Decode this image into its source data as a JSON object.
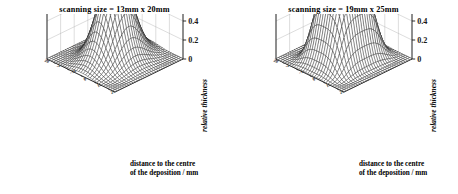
{
  "figure": {
    "background_color": "#ffffff",
    "ink_color": "#1a1a1a",
    "grid_color": "#b4b4b4"
  },
  "panels": [
    {
      "id": "left",
      "title": "scanning size =  13mm x 20mm",
      "scanning_size": "13mm x 20mm",
      "xlabel_line1": "distance to the centre",
      "xlabel_line2": "of the deposition / mm",
      "zlabel": "relative thickness",
      "z_ticks": [
        "1",
        "0.8",
        "0.6",
        "0.4",
        "0.2",
        "0"
      ],
      "x_ticks": [
        "-20",
        "-10",
        "0",
        "10",
        "20"
      ],
      "y_ticks": [
        "-20",
        "-10",
        "0",
        "10",
        "20"
      ]
    },
    {
      "id": "right",
      "title": "scanning size =  19mm x 25mm",
      "scanning_size": "19mm x 25mm",
      "xlabel_line1": "distance to the centre",
      "xlabel_line2": "of the deposition / mm",
      "zlabel": "relative thickness",
      "z_ticks": [
        "1",
        "0.8",
        "0.6",
        "0.4",
        "0.2",
        "0"
      ],
      "x_ticks": [
        "-20",
        "-10",
        "0",
        "10",
        "20"
      ],
      "y_ticks": [
        "-20",
        "-10",
        "0",
        "10",
        "20"
      ]
    }
  ],
  "chart_data": [
    {
      "type": "surface",
      "panel": "left",
      "title": "scanning size =  13mm x 20mm",
      "xlabel": "distance to the centre of the deposition / mm",
      "ylabel": "distance to the centre of the deposition / mm",
      "zlabel": "relative thickness",
      "zlim": [
        0,
        1
      ],
      "z_ticks": [
        0,
        0.2,
        0.4,
        0.6,
        0.8,
        1
      ],
      "xlim": [
        -25,
        25
      ],
      "ylim": [
        -25,
        25
      ],
      "x_ticks": [
        -20,
        -10,
        0,
        10,
        20
      ],
      "y_ticks": [
        -20,
        -10,
        0,
        10,
        20
      ],
      "grid": true,
      "legend": "none",
      "mesh_n": 30,
      "surface_model": {
        "form": "gaussian_peak",
        "peak_value": 1.0,
        "centre_x": 0,
        "centre_y": 0,
        "sigma_x": 7.5,
        "sigma_y": 9.5,
        "flatness_exponent": 2.0,
        "note": "sharp single peak, narrow scan area 13mm x 20mm"
      },
      "z_profile_along_x_at_y0": [
        0.01,
        0.02,
        0.04,
        0.08,
        0.16,
        0.3,
        0.5,
        0.72,
        0.9,
        1.0,
        0.9,
        0.72,
        0.5,
        0.3,
        0.16,
        0.08,
        0.04,
        0.02,
        0.01
      ]
    },
    {
      "type": "surface",
      "panel": "right",
      "title": "scanning size =  19mm x 25mm",
      "xlabel": "distance to the centre of the deposition / mm",
      "ylabel": "distance to the centre of the deposition / mm",
      "zlabel": "relative thickness",
      "zlim": [
        0,
        1
      ],
      "z_ticks": [
        0,
        0.2,
        0.4,
        0.6,
        0.8,
        1
      ],
      "xlim": [
        -25,
        25
      ],
      "ylim": [
        -25,
        25
      ],
      "x_ticks": [
        -20,
        -10,
        0,
        10,
        20
      ],
      "y_ticks": [
        -20,
        -10,
        0,
        10,
        20
      ],
      "grid": true,
      "legend": "none",
      "mesh_n": 30,
      "surface_model": {
        "form": "super_gaussian_plateau",
        "peak_value": 1.0,
        "centre_x": 0,
        "centre_y": 0,
        "sigma_x": 11.0,
        "sigma_y": 13.0,
        "flatness_exponent": 3.4,
        "note": "broader, flat-topped plateau, wider scan area 19mm x 25mm"
      },
      "z_profile_along_x_at_y0": [
        0.02,
        0.05,
        0.12,
        0.28,
        0.52,
        0.76,
        0.92,
        0.98,
        1.0,
        1.0,
        1.0,
        0.98,
        0.92,
        0.76,
        0.52,
        0.28,
        0.12,
        0.05,
        0.02
      ]
    }
  ]
}
